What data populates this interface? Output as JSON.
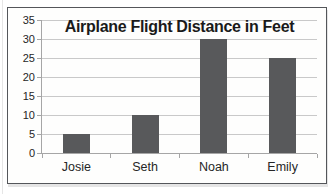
{
  "chart_data": {
    "type": "bar",
    "title": "Airplane Flight Distance in Feet",
    "categories": [
      "Josie",
      "Seth",
      "Noah",
      "Emily"
    ],
    "values": [
      5,
      10,
      30,
      25
    ],
    "xlabel": "",
    "ylabel": "",
    "ylim": [
      0,
      35
    ],
    "yticks": [
      0,
      5,
      10,
      15,
      20,
      25,
      30,
      35
    ],
    "grid": true,
    "legend": "none",
    "colors": {
      "bar": "#58595b",
      "gridline": "#c9c9c9",
      "axis": "#a6a6a6",
      "tick_label": "#262626",
      "title": "#1a1a1a",
      "frame_border": "#54565a",
      "plot_background": "#fefefd"
    }
  }
}
